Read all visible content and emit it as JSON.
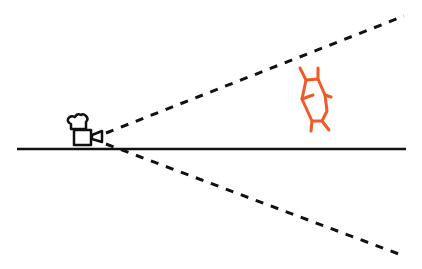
{
  "diagram": {
    "elements": {
      "ground_line": {
        "label": "ground line",
        "color": "#111111"
      },
      "camera": {
        "label": "camera",
        "icon": "movie-camera-icon",
        "color": "#111111"
      },
      "fov_upper": {
        "label": "field of view upper boundary",
        "style": "dashed",
        "color": "#111111"
      },
      "fov_lower": {
        "label": "field of view lower boundary",
        "style": "dashed",
        "color": "#111111"
      },
      "molecule": {
        "label": "hexagonal molecule",
        "icon": "hexagon-molecule-icon",
        "color": "#f05a28"
      }
    }
  }
}
